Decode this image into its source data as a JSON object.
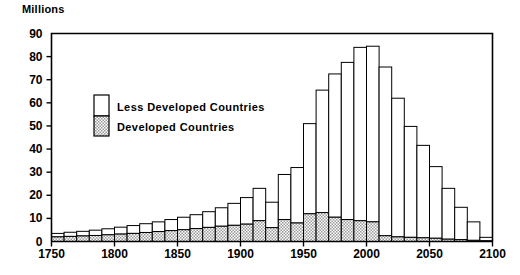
{
  "chart_data": {
    "type": "bar",
    "title": "",
    "subtitle": "",
    "ylabel": "Millions",
    "xlabel": "",
    "ylim": [
      0,
      90
    ],
    "xlim": [
      1750,
      2100
    ],
    "grid": false,
    "stacked": true,
    "bar_interval_years": 10,
    "legend_position": "inside-upper-left",
    "ytick_labels": [
      "0",
      "10",
      "20",
      "30",
      "40",
      "50",
      "60",
      "70",
      "80",
      "90"
    ],
    "ytick_values": [
      0,
      10,
      20,
      30,
      40,
      50,
      60,
      70,
      80,
      90
    ],
    "xtick_labels": [
      "1750",
      "1800",
      "1850",
      "1900",
      "1950",
      "2000",
      "2050",
      "2100"
    ],
    "xtick_values": [
      1750,
      1800,
      1850,
      1900,
      1950,
      2000,
      2050,
      2100
    ],
    "categories": [
      1750,
      1760,
      1770,
      1780,
      1790,
      1800,
      1810,
      1820,
      1830,
      1840,
      1850,
      1860,
      1870,
      1880,
      1890,
      1900,
      1910,
      1920,
      1930,
      1940,
      1950,
      1960,
      1970,
      1980,
      1990,
      2000,
      2010,
      2020,
      2030,
      2040,
      2050,
      2060,
      2070,
      2080,
      2090
    ],
    "series": [
      {
        "name": "Less Developed Countries",
        "fill": "#ffffff",
        "pattern": "solid-white",
        "values": [
          1.5,
          1.8,
          2.0,
          2.3,
          2.6,
          3.0,
          3.4,
          3.8,
          4.2,
          4.8,
          5.4,
          6.0,
          6.8,
          8.0,
          9.5,
          11.5,
          14.0,
          11.0,
          19.5,
          24.0,
          39.0,
          53.0,
          62.0,
          68.0,
          75.0,
          76.0,
          73.0,
          60.0,
          48.0,
          40.0,
          31.0,
          22.0,
          14.0,
          8.0,
          1.5
        ]
      },
      {
        "name": "Developed Countries",
        "fill": "#c8c8c8",
        "pattern": "checker",
        "values": [
          2.0,
          2.2,
          2.4,
          2.6,
          2.9,
          3.2,
          3.5,
          3.9,
          4.3,
          4.7,
          5.1,
          5.6,
          6.1,
          6.6,
          7.0,
          7.5,
          9.0,
          6.0,
          9.5,
          8.0,
          12.0,
          12.5,
          10.5,
          9.5,
          9.0,
          8.5,
          2.5,
          2.0,
          1.8,
          1.6,
          1.4,
          1.0,
          0.8,
          0.5,
          0.3
        ]
      }
    ],
    "totals": [
      3.5,
      4.0,
      4.4,
      4.9,
      5.5,
      6.2,
      6.9,
      7.7,
      8.5,
      9.5,
      10.5,
      11.6,
      12.9,
      14.6,
      16.5,
      19.0,
      23.0,
      17.0,
      29.0,
      32.0,
      51.0,
      65.5,
      72.5,
      77.5,
      84.0,
      84.5,
      75.5,
      62.0,
      49.8,
      41.6,
      32.4,
      23.0,
      14.8,
      8.5,
      1.8
    ]
  },
  "legend": {
    "entries": [
      {
        "label": "Less Developed Countries"
      },
      {
        "label": "Developed Countries"
      }
    ]
  }
}
